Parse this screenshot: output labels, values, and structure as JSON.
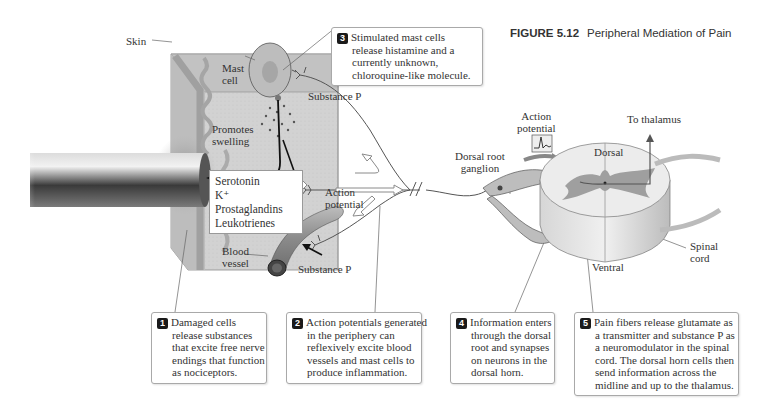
{
  "figure": {
    "number": "FIGURE 5.12",
    "title": "Peripheral Mediation of Pain"
  },
  "labels": {
    "skin": "Skin",
    "mast_cell_line1": "Mast",
    "mast_cell_line2": "cell",
    "substance_p_top": "Substance P",
    "promotes_line1": "Promotes",
    "promotes_line2": "swelling",
    "action_potential_line1": "Action",
    "action_potential_line2": "potential",
    "blood_vessel_line1": "Blood",
    "blood_vessel_line2": "vessel",
    "substance_p_bottom": "Substance P",
    "dorsal_root_line1": "Dorsal root",
    "dorsal_root_line2": "ganglion",
    "ap_trace_line1": "Action",
    "ap_trace_line2": "potential",
    "to_thalamus": "To thalamus",
    "dorsal": "Dorsal",
    "ventral": "Ventral",
    "spinal_cord_line1": "Spinal",
    "spinal_cord_line2": "cord"
  },
  "released_substances": [
    "Serotonin",
    "K⁺",
    "Prostaglandins",
    "Leukotrienes"
  ],
  "callouts": [
    {
      "badge": "1",
      "lines": [
        "Damaged cells",
        "release substances",
        "that excite free nerve",
        "endings that function",
        "as nociceptors."
      ]
    },
    {
      "badge": "2",
      "lines": [
        "Action potentials generated",
        "in the periphery can",
        "reflexively excite blood",
        "vessels and mast cells to",
        "produce inflammation."
      ]
    },
    {
      "badge": "3",
      "lines": [
        "Stimulated mast cells",
        "release histamine and a",
        "currently unknown,",
        "chloroquine-like molecule."
      ]
    },
    {
      "badge": "4",
      "lines": [
        "Information enters",
        "through the dorsal",
        "root and synapses",
        "on neurons in the",
        "dorsal horn."
      ]
    },
    {
      "badge": "5",
      "lines": [
        "Pain fibers release glutamate as",
        "a transmitter and substance P as",
        "a neuromodulator in the spinal",
        "cord. The dorsal horn cells then",
        "send information across the",
        "midline and up to the thalamus."
      ]
    }
  ],
  "colors": {
    "tissue": "#c9c9c9",
    "tissue_dark": "#a8a8a8",
    "cord_white": "#e6e6e6",
    "cord_gray": "#9a9a9a",
    "ink": "#333333"
  }
}
